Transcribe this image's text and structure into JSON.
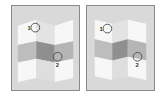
{
  "diagram": {
    "panels": [
      {
        "id": "left",
        "fold": "mountain",
        "markers": [
          {
            "label": "1",
            "cx": 21,
            "cy": 22
          },
          {
            "label": "2",
            "cx": 47,
            "cy": 52
          }
        ]
      },
      {
        "id": "right",
        "fold": "valley",
        "markers": [
          {
            "label": "1",
            "cx": 18,
            "cy": 23
          },
          {
            "label": "2",
            "cx": 52,
            "cy": 52
          }
        ]
      }
    ],
    "grid": {
      "columns": 3,
      "rows": 3
    },
    "colors": {
      "panel_bg": "#d9d9d9",
      "panel_border": "#8a8a8a",
      "white_face": "#f7f7f7",
      "light_shade": "#e6e6e6",
      "mid_gray": "#b5b5b5",
      "dark_gray": "#8f8f8f",
      "marker_stroke": "#555555"
    }
  }
}
